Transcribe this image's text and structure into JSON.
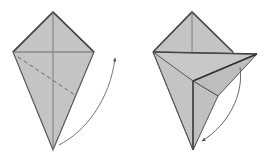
{
  "diagram": {
    "type": "origami-fold-steps",
    "steps": [
      {
        "id": "step-1",
        "description": "Kite base with dashed valley-fold line; arrow shows bottom point folded up to the right",
        "paper_color": "#c2c2c2",
        "line_color": "#555555",
        "arrow": "curved arrow from bottom point up to the right"
      },
      {
        "id": "step-2",
        "description": "Flap folded out to the right; arrow shows it being folded back down",
        "paper_color": "#c2c2c2",
        "line_color": "#555555",
        "arrow": "curved arrow from right flap tip down to the bottom"
      }
    ]
  }
}
